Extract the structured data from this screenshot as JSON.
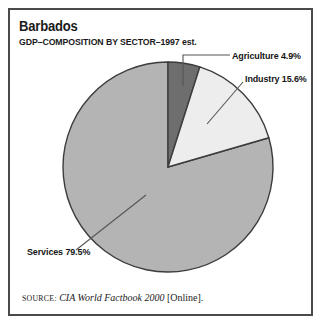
{
  "figure": {
    "title": "Barbados",
    "subtitle": "GDP–COMPOSITION BY SECTOR–1997 est."
  },
  "source": {
    "label": "SOURCE:",
    "publication": "CIA World Factbook 2000",
    "suffix": "[Online]."
  },
  "labels": {
    "agriculture": "Agriculture 4.9%",
    "industry": "Industry 15.6%",
    "services": "Services 79.5%"
  },
  "colors": {
    "agriculture": "#6e6e6e",
    "industry": "#ededed",
    "services": "#b4b4b4",
    "outline": "#3c3c3c",
    "frame": "#4a4a4a",
    "leader": "#555555",
    "text": "#141414",
    "background": "#ffffff"
  },
  "chart_data": {
    "type": "pie",
    "title": "Barbados",
    "subtitle": "GDP–COMPOSITION BY SECTOR–1997 est.",
    "xlabel": "",
    "ylabel": "",
    "unit": "percent",
    "start_angle_deg": 0,
    "direction": "clockwise",
    "legend": "none",
    "grid": false,
    "categories": [
      "Agriculture",
      "Industry",
      "Services"
    ],
    "values": [
      4.9,
      15.6,
      79.5
    ],
    "slices": [
      {
        "name": "Agriculture",
        "value": 4.9,
        "label": "Agriculture 4.9%",
        "color": "#6e6e6e",
        "start_deg": 0.0,
        "end_deg": 17.64
      },
      {
        "name": "Industry",
        "value": 15.6,
        "label": "Industry 15.6%",
        "color": "#ededed",
        "start_deg": 17.64,
        "end_deg": 73.8
      },
      {
        "name": "Services",
        "value": 79.5,
        "label": "Services 79.5%",
        "color": "#b4b4b4",
        "start_deg": 73.8,
        "end_deg": 360.0
      }
    ],
    "total": 100.0,
    "annotations": [
      "SOURCE: CIA World Factbook 2000 [Online]."
    ]
  }
}
